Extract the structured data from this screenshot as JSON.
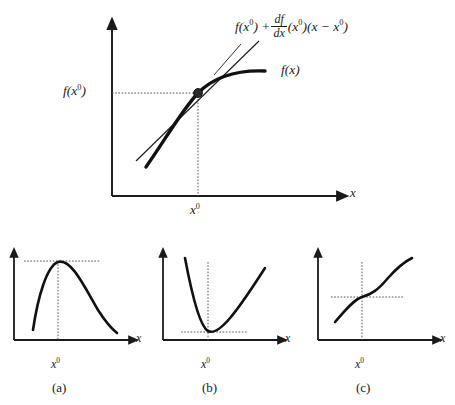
{
  "figure": {
    "background_color": "#ffffff",
    "ink_color": "#1a1a1a",
    "curve_color": "#111111",
    "dotted_color": "#555555"
  },
  "main_plot": {
    "name": "tangent-line-approximation",
    "y_axis_label": "f(x",
    "y_axis_label_sup": "0",
    "y_axis_label_close": ")",
    "x_axis_label": "x",
    "x_tick_label": "x",
    "x_tick_sup": "0",
    "curve_label": "f(x)",
    "formula": {
      "part1": "f(x",
      "part1_sup": "0",
      "part2": ") +",
      "frac_num": "df",
      "frac_den": "dx",
      "part3": "(x",
      "part3_sup": "0",
      "part4": ")(x − x",
      "part4_sup": "0",
      "part5": ")"
    },
    "axes": {
      "origin_x": 112,
      "origin_y": 196,
      "y_axis_top": 22,
      "x_axis_right": 345
    },
    "tangent_point": {
      "x": 198,
      "y": 93
    },
    "has_dotted_guides": true,
    "marker": "filled-dot"
  },
  "panels": [
    {
      "id": "a",
      "name": "maximum-panel",
      "caption": "(a)",
      "description": "concave function with interior maximum at x-zero",
      "x_axis_label": "x",
      "x_tick_label": "x",
      "x_tick_sup": "0",
      "stationary_type": "maximum",
      "origin_x": 14,
      "origin_y": 340,
      "x_axis_right": 134,
      "y_axis_top": 252,
      "stationary_x": 58,
      "stationary_y": 261
    },
    {
      "id": "b",
      "name": "minimum-panel",
      "caption": "(b)",
      "description": "convex function with interior minimum at x-zero",
      "x_axis_label": "x",
      "x_tick_label": "x",
      "x_tick_sup": "0",
      "stationary_type": "minimum",
      "origin_x": 163,
      "origin_y": 340,
      "x_axis_right": 283,
      "y_axis_top": 252,
      "stationary_x": 208,
      "stationary_y": 333
    },
    {
      "id": "c",
      "name": "inflection-panel",
      "caption": "(c)",
      "description": "function with inflection point at x-zero",
      "x_axis_label": "x",
      "x_tick_label": "x",
      "x_tick_sup": "0",
      "stationary_type": "inflection",
      "origin_x": 318,
      "origin_y": 340,
      "x_axis_right": 438,
      "y_axis_top": 252,
      "stationary_x": 362,
      "stationary_y": 297
    }
  ]
}
